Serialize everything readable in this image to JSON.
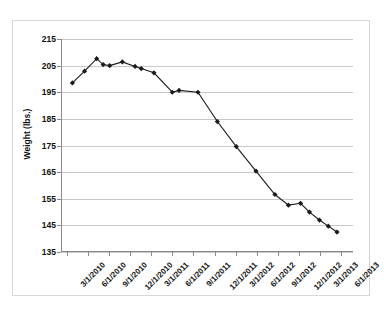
{
  "chart_data": {
    "type": "line",
    "title": "",
    "xlabel": "",
    "ylabel": "Weight (lbs.)",
    "ylim": [
      135,
      215
    ],
    "ytick_step": 10,
    "yticks": [
      135,
      145,
      155,
      165,
      175,
      185,
      195,
      205,
      215
    ],
    "grid": true,
    "legend": "none",
    "marker": "diamond",
    "series_color": "#1a1a1a",
    "grid_color": "#c9c9c9",
    "axis_color": "#8a8a8a",
    "xtick_labels": [
      "3/1/2010",
      "6/1/2010",
      "9/1/2010",
      "12/1/2010",
      "3/1/2011",
      "6/1/2011",
      "9/1/2011",
      "12/1/2011",
      "3/1/2012",
      "6/1/2012",
      "9/1/2012",
      "12/1/2012",
      "3/1/2013",
      "6/1/2013"
    ],
    "x": [
      "3/1/2010",
      "4/1/2010",
      "5/1/2010",
      "6/1/2010",
      "7/1/2010",
      "8/1/2010",
      "9/1/2010",
      "11/1/2010",
      "12/1/2010",
      "1/1/2011",
      "2/1/2011",
      "4/1/2011",
      "6/1/2011",
      "7/1/2011",
      "8/1/2011",
      "10/1/2011",
      "12/1/2011",
      "2/1/2012",
      "4/1/2012",
      "6/1/2012",
      "8/1/2012",
      "10/1/2012",
      "12/1/2012",
      "2/1/2013",
      "4/1/2013",
      "6/1/2013",
      "7/1/2013"
    ],
    "values": [
      198.5,
      203.0,
      207.5,
      205.3,
      205.0,
      206.5,
      204.8,
      203.9,
      202.3,
      195.0,
      195.7,
      195.0,
      184.0,
      174.5,
      165.3,
      156.5,
      152.5,
      153.2,
      150.0,
      147.0,
      144.6,
      142.5,
      142.5,
      142.5,
      142.5,
      142.5,
      142.5
    ],
    "series": [
      {
        "name": "Weight",
        "points": [
          {
            "x": "3/1/2010",
            "y": 198.5
          },
          {
            "x": "4/1/2010",
            "y": 203.0
          },
          {
            "x": "5/1/2010",
            "y": 207.5
          },
          {
            "x": "6/1/2010",
            "y": 205.3
          },
          {
            "x": "7/1/2010",
            "y": 205.0
          },
          {
            "x": "8/1/2010",
            "y": 206.5
          },
          {
            "x": "9/1/2010",
            "y": 204.8
          },
          {
            "x": "10/1/2010",
            "y": 203.9
          },
          {
            "x": "11/1/2010",
            "y": 202.3
          },
          {
            "x": "12/1/2010",
            "y": 195.0
          },
          {
            "x": "1/1/2011",
            "y": 195.7
          },
          {
            "x": "2/1/2011",
            "y": 195.0
          },
          {
            "x": "3/1/2011",
            "y": 184.0
          },
          {
            "x": "4/1/2011",
            "y": 174.5
          },
          {
            "x": "5/1/2011",
            "y": 165.3
          },
          {
            "x": "6/1/2011",
            "y": 156.5
          },
          {
            "x": "7/1/2011",
            "y": 152.5
          },
          {
            "x": "8/1/2011",
            "y": 153.2
          },
          {
            "x": "9/1/2011",
            "y": 150.0
          },
          {
            "x": "10/1/2011",
            "y": 147.0
          },
          {
            "x": "11/1/2011",
            "y": 144.6
          },
          {
            "x": "12/1/2011",
            "y": 142.5
          }
        ]
      }
    ],
    "plot_points": [
      {
        "px": 0.02,
        "v": 198.5
      },
      {
        "px": 0.065,
        "v": 202.9
      },
      {
        "px": 0.11,
        "v": 207.6
      },
      {
        "px": 0.134,
        "v": 205.4
      },
      {
        "px": 0.158,
        "v": 205.0
      },
      {
        "px": 0.205,
        "v": 206.4
      },
      {
        "px": 0.252,
        "v": 204.7
      },
      {
        "px": 0.275,
        "v": 203.9
      },
      {
        "px": 0.322,
        "v": 202.3
      },
      {
        "px": 0.39,
        "v": 195.0
      },
      {
        "px": 0.415,
        "v": 195.7
      },
      {
        "px": 0.485,
        "v": 195.0
      },
      {
        "px": 0.557,
        "v": 184.0
      },
      {
        "px": 0.627,
        "v": 174.6
      },
      {
        "px": 0.7,
        "v": 165.4
      },
      {
        "px": 0.77,
        "v": 156.6
      },
      {
        "px": 0.82,
        "v": 152.6
      },
      {
        "px": 0.865,
        "v": 153.3
      },
      {
        "px": 0.898,
        "v": 150.0
      },
      {
        "px": 0.935,
        "v": 147.0
      },
      {
        "px": 0.968,
        "v": 144.7
      },
      {
        "px": 1.0,
        "v": 142.5
      }
    ]
  }
}
